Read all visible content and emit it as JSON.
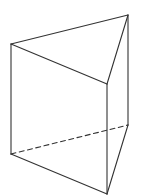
{
  "diagram": {
    "title": "",
    "type": "triangular-prism",
    "colors": {
      "background": "#ffffff",
      "stroke": "#333333"
    },
    "vertices": {
      "A": {
        "x": 11,
        "y": 44
      },
      "B": {
        "x": 128,
        "y": 15
      },
      "C": {
        "x": 107,
        "y": 84
      },
      "D": {
        "x": 11,
        "y": 154
      },
      "E": {
        "x": 128,
        "y": 125
      },
      "F": {
        "x": 107,
        "y": 194
      }
    },
    "edges": [
      {
        "id": "top-AB",
        "from": "A",
        "to": "B",
        "style": "solid"
      },
      {
        "id": "top-BC",
        "from": "B",
        "to": "C",
        "style": "solid"
      },
      {
        "id": "top-CA",
        "from": "C",
        "to": "A",
        "style": "solid"
      },
      {
        "id": "lateral-AD",
        "from": "A",
        "to": "D",
        "style": "solid"
      },
      {
        "id": "lateral-BE",
        "from": "B",
        "to": "E",
        "style": "solid"
      },
      {
        "id": "lateral-CF",
        "from": "C",
        "to": "F",
        "style": "solid"
      },
      {
        "id": "bottom-DE",
        "from": "D",
        "to": "E",
        "style": "dashed"
      },
      {
        "id": "bottom-EF",
        "from": "E",
        "to": "F",
        "style": "solid"
      },
      {
        "id": "bottom-FD",
        "from": "F",
        "to": "D",
        "style": "solid"
      }
    ]
  }
}
